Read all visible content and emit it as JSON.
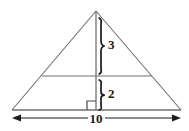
{
  "figure": {
    "type": "geometry-diagram",
    "shape": "isosceles-triangle",
    "background_color": "#ffffff",
    "line_color": "#707070",
    "annotation_color": "#1a1a1a",
    "labels": {
      "upper_segment": "3",
      "lower_segment": "2",
      "base": "10"
    },
    "geometry": {
      "apex": [
        96,
        11
      ],
      "base_left": [
        12,
        110
      ],
      "base_right": [
        181,
        110
      ],
      "altitude_foot": [
        96,
        110
      ],
      "midline_y": 76,
      "midline_left_x": 42,
      "midline_right_x": 152,
      "right_angle_marker": [
        87,
        101,
        9,
        9
      ],
      "dimension_line_y": 118
    },
    "braces": {
      "upper": {
        "top": 18,
        "bottom": 74,
        "x": 100,
        "label": "3"
      },
      "lower": {
        "top": 80,
        "bottom": 110,
        "x": 100,
        "label": "2"
      }
    },
    "measurements": {
      "total_height": "5",
      "upper_height": "3",
      "lower_height": "2",
      "base_length": "10"
    }
  }
}
